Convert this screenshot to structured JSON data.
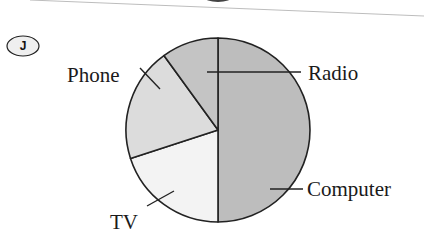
{
  "question_marker": "J",
  "chart_data": {
    "type": "pie",
    "title": "",
    "categories": [
      "Computer",
      "TV",
      "Phone",
      "Radio"
    ],
    "values": [
      50,
      20,
      20,
      10
    ],
    "unit": "percent (estimated from slice angles)",
    "start_angle_deg_clockwise_from_top": 0,
    "direction": "clockwise",
    "colors": [
      "#bdbdbd",
      "#f3f3f3",
      "#dcdcdc",
      "#c4c4c4"
    ],
    "legend": "none (leader-line labels)",
    "labels": [
      {
        "text": "Computer",
        "position": "right-bottom"
      },
      {
        "text": "TV",
        "position": "bottom-left"
      },
      {
        "text": "Phone",
        "position": "upper-left"
      },
      {
        "text": "Radio",
        "position": "upper-right"
      }
    ]
  },
  "labels": {
    "computer": "Computer",
    "tv": "TV",
    "phone": "Phone",
    "radio": "Radio"
  }
}
